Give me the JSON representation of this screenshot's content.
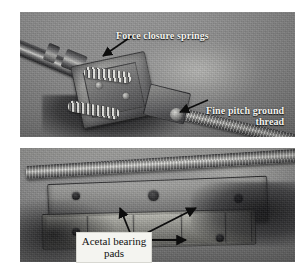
{
  "figure": {
    "type": "photograph-pair",
    "orientation": "stacked",
    "panel_count": 2,
    "palette": {
      "page_background": "#ffffff",
      "photo_background": "#8b8b8b",
      "annotation_text_light": "#f2f2ee",
      "annotation_text_dark": "#111111",
      "label_box_fill": "#f4f4f0",
      "leader_line": "#111111",
      "metal_highlight": "#e2e2de",
      "metal_shadow": "#2c2c2e"
    }
  },
  "panels": [
    {
      "id": "panel-top",
      "name": "top-photo",
      "description": "Close-up of a spring-loaded nut assembly mounted on a fine pitch ground leadscrew, photographed at an angle against a plain grey background.",
      "annotations": [
        {
          "id": "force-closure-springs",
          "text": "Force closure springs",
          "style": "white-serif-bold",
          "lines": [
            "Force closure springs"
          ],
          "leader": "arrow-down-left"
        },
        {
          "id": "fine-pitch-ground-thread",
          "text": "Fine pitch ground thread",
          "style": "white-serif-bold",
          "lines": [
            "Fine pitch ground",
            "thread"
          ],
          "leader": "arrow-down-left"
        }
      ]
    },
    {
      "id": "panel-bottom",
      "name": "bottom-photo",
      "description": "Side view of the carriage assembly showing the leadscrew and the stepped bearing pad blocks beneath it.",
      "annotations": [
        {
          "id": "acetal-bearing-pads",
          "text": "Acetal bearing pads",
          "style": "black-serif-on-white-box",
          "lines": [
            "Acetal bearing",
            "pads"
          ],
          "leader": "three-arrows-fan"
        }
      ]
    }
  ],
  "labels": {
    "springs": "Force closure springs",
    "thread_line1": "Fine pitch ground",
    "thread_line2": "thread",
    "pads_line1": "Acetal bearing",
    "pads_line2": "pads"
  }
}
